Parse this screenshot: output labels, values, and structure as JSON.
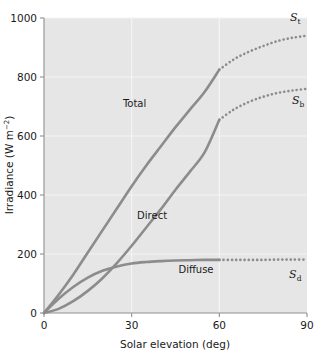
{
  "chart_data": {
    "type": "line",
    "title": "",
    "xlabel": "Solar elevation (deg)",
    "ylabel": "Irradiance (W m−2)",
    "ylabel_base": "Irradiance (W m",
    "ylabel_sup": "−2",
    "ylabel_tail": ")",
    "xlim": [
      0,
      90
    ],
    "ylim": [
      0,
      1000
    ],
    "xticks": [
      0,
      30,
      60,
      90
    ],
    "xtick_labels": [
      "0",
      "30",
      "60",
      "90"
    ],
    "yticks": [
      0,
      200,
      400,
      600,
      800,
      1000
    ],
    "ytick_labels": [
      "0",
      "200",
      "400",
      "600",
      "800",
      "1000"
    ],
    "grid": true,
    "grid_color": "#f4f4f4",
    "plot_background": "#e6e6e6",
    "page_background": "#ffffff",
    "curve_color": "#8c8c8c",
    "axis_color": "#9a9a9a",
    "legend": "inline-labels",
    "solid_to_dotted_at_x": 60,
    "series": [
      {
        "name": "Total",
        "symbol": "S",
        "subscript": "t",
        "label": "Total",
        "x": [
          0,
          5,
          10,
          15,
          20,
          25,
          30,
          35,
          40,
          45,
          50,
          55,
          60,
          65,
          70,
          75,
          80,
          85,
          90
        ],
        "values": [
          0,
          62,
          130,
          205,
          280,
          355,
          430,
          500,
          565,
          630,
          690,
          750,
          825,
          860,
          885,
          905,
          922,
          933,
          940
        ]
      },
      {
        "name": "Direct",
        "symbol": "S",
        "subscript": "b",
        "label": "Direct",
        "x": [
          0,
          5,
          10,
          15,
          20,
          25,
          30,
          35,
          40,
          45,
          50,
          55,
          60,
          65,
          70,
          75,
          80,
          85,
          90
        ],
        "values": [
          0,
          14,
          40,
          75,
          118,
          170,
          228,
          290,
          352,
          418,
          480,
          545,
          655,
          690,
          715,
          733,
          746,
          754,
          760
        ]
      },
      {
        "name": "Diffuse",
        "symbol": "S",
        "subscript": "d",
        "label": "Diffuse",
        "x": [
          0,
          5,
          10,
          15,
          20,
          25,
          30,
          35,
          40,
          45,
          50,
          55,
          60,
          65,
          70,
          75,
          80,
          85,
          90
        ],
        "values": [
          0,
          48,
          88,
          120,
          143,
          158,
          168,
          173,
          176,
          178,
          179,
          180,
          180,
          180,
          180,
          180,
          181,
          181,
          181
        ]
      }
    ],
    "annotations": [
      {
        "name": "total-curve-label",
        "text": "Total",
        "x": 31,
        "y": 700
      },
      {
        "name": "direct-curve-label",
        "text": "Direct",
        "x": 37,
        "y": 320
      },
      {
        "name": "diffuse-curve-label",
        "text": "Diffuse",
        "x": 52,
        "y": 135
      },
      {
        "name": "st-symbol-label",
        "symbol": "S",
        "sub": "t",
        "x": 86,
        "y": 990
      },
      {
        "name": "sb-symbol-label",
        "symbol": "S",
        "sub": "b",
        "x": 87,
        "y": 710
      },
      {
        "name": "sd-symbol-label",
        "symbol": "S",
        "sub": "d",
        "x": 86,
        "y": 120
      }
    ]
  }
}
